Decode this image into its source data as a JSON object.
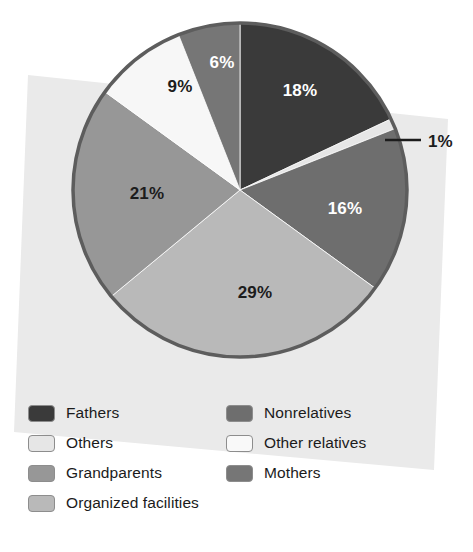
{
  "chart_data": {
    "type": "pie",
    "title": "",
    "subtitle": "",
    "xlabel": "",
    "ylabel": "",
    "grid": false,
    "legend_position": "bottom",
    "unit": "%",
    "start_angle_deg": 0,
    "direction": "clockwise",
    "categories": [
      "Fathers",
      "Others",
      "Nonrelatives",
      "Organized facilities",
      "Grandparents",
      "Other relatives",
      "Mothers"
    ],
    "values": [
      18,
      1,
      16,
      29,
      21,
      9,
      6
    ],
    "slice_labels": [
      "18%",
      "1%",
      "16%",
      "29%",
      "21%",
      "9%",
      "6%"
    ],
    "colors": [
      "#3a3a3a",
      "#e6e6e6",
      "#6e6e6e",
      "#b9b9b9",
      "#979797",
      "#f7f7f7",
      "#767676"
    ],
    "slices": [
      {
        "label": "Fathers",
        "value": 18,
        "display": "18%",
        "color": "#3a3a3a",
        "label_color": "#ffffff",
        "label_inside": true,
        "label_x": 300,
        "label_y": 96
      },
      {
        "label": "Others",
        "value": 1,
        "display": "1%",
        "color": "#e6e6e6",
        "label_color": "#1c1c1c",
        "label_inside": false,
        "label_x": 434,
        "label_y": 145
      },
      {
        "label": "Nonrelatives",
        "value": 16,
        "display": "16%",
        "color": "#6e6e6e",
        "label_color": "#ffffff",
        "label_inside": true,
        "label_x": 345,
        "label_y": 214
      },
      {
        "label": "Organized facilities",
        "value": 29,
        "display": "29%",
        "color": "#b9b9b9",
        "label_color": "#1c1c1c",
        "label_inside": true,
        "label_x": 255,
        "label_y": 298
      },
      {
        "label": "Grandparents",
        "value": 21,
        "display": "21%",
        "color": "#979797",
        "label_color": "#1c1c1c",
        "label_inside": true,
        "label_x": 147,
        "label_y": 199
      },
      {
        "label": "Other relatives",
        "value": 9,
        "display": "9%",
        "color": "#f7f7f7",
        "label_color": "#1c1c1c",
        "label_inside": true,
        "label_x": 180,
        "label_y": 92
      },
      {
        "label": "Mothers",
        "value": 6,
        "display": "6%",
        "color": "#767676",
        "label_color": "#ffffff",
        "label_inside": true,
        "label_x": 222,
        "label_y": 68
      }
    ],
    "callout": {
      "label": "1%",
      "leader_from_x": 385,
      "leader_from_y": 140,
      "leader_to_x": 421,
      "leader_to_y": 140
    }
  },
  "legend": {
    "columns": 2,
    "items": [
      {
        "label": "Fathers",
        "color": "#3a3a3a",
        "column": 0,
        "row": 0
      },
      {
        "label": "Nonrelatives",
        "color": "#6e6e6e",
        "column": 1,
        "row": 0
      },
      {
        "label": "Others",
        "color": "#e6e6e6",
        "column": 0,
        "row": 1
      },
      {
        "label": "Other relatives",
        "color": "#f9f9f9",
        "column": 1,
        "row": 1
      },
      {
        "label": "Grandparents",
        "color": "#979797",
        "column": 0,
        "row": 2
      },
      {
        "label": "Mothers",
        "color": "#767676",
        "column": 1,
        "row": 2
      },
      {
        "label": "Organized facilities",
        "color": "#b9b9b9",
        "column": 0,
        "row": 3
      }
    ]
  },
  "style": {
    "pie_outline_color": "#5d5d5d",
    "paper_background_color": "#eaeaea",
    "page_background_color": "#ffffff",
    "pie_center_x": 240,
    "pie_center_y": 190,
    "pie_radius": 167
  }
}
